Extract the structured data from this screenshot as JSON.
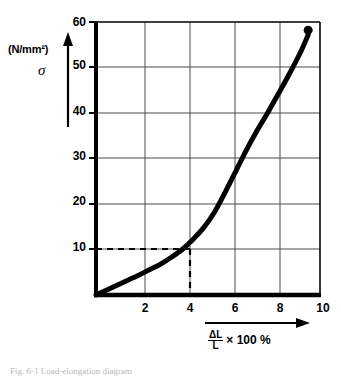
{
  "figure": {
    "caption": "Fig. 6-1   Load-elongation diagram"
  },
  "chart_data": {
    "type": "line",
    "title": "",
    "subtitle": "",
    "xlabel": "ΔL / L × 100 %",
    "ylabel": "σ",
    "y_unit": "(N/mm²)",
    "xlim": [
      0,
      10.4
    ],
    "ylim": [
      0,
      60
    ],
    "xticks": [
      2,
      4,
      6,
      8,
      10
    ],
    "yticks": [
      10,
      20,
      30,
      40,
      50,
      60
    ],
    "xtick_labels": [
      "2",
      "4",
      "6",
      "8",
      "10"
    ],
    "ytick_labels": [
      "10",
      "20",
      "30",
      "40",
      "50",
      "60"
    ],
    "grid": true,
    "legend": "none",
    "line_color": "#000000",
    "grid_color": "#4a4a4a",
    "axis_color": "#000000",
    "x": [
      0,
      0.5,
      1,
      1.5,
      2,
      2.5,
      3,
      3.5,
      4,
      4.5,
      5,
      5.5,
      6,
      6.5,
      7,
      7.5,
      8,
      8.5,
      9,
      9.5,
      9.85
    ],
    "y": [
      0,
      1.1,
      2.2,
      3.3,
      4.4,
      5.6,
      6.8,
      8.3,
      10.0,
      12.2,
      14.8,
      18.2,
      22.6,
      27.3,
      32.0,
      36.3,
      40.3,
      44.5,
      48.8,
      53.4,
      57.2
    ],
    "series": [
      {
        "name": "stress-strain curve",
        "x": [
          0,
          0.5,
          1,
          1.5,
          2,
          2.5,
          3,
          3.5,
          4,
          4.5,
          5,
          5.5,
          6,
          6.5,
          7,
          7.5,
          8,
          8.5,
          9,
          9.5,
          9.85
        ],
        "y": [
          0,
          1.1,
          2.2,
          3.3,
          4.4,
          5.6,
          6.8,
          8.3,
          10.0,
          12.2,
          14.8,
          18.2,
          22.6,
          27.3,
          32.0,
          36.3,
          40.3,
          44.5,
          48.8,
          53.4,
          57.2
        ]
      }
    ],
    "endpoint_marker": {
      "x": 9.85,
      "y": 58.2,
      "shape": "circle",
      "label": ""
    },
    "annotations": [
      {
        "type": "guide-lines",
        "style": "dashed",
        "x": 4,
        "y": 10,
        "note": "dashed construction lines from y=10 to curve at x=4"
      }
    ]
  }
}
